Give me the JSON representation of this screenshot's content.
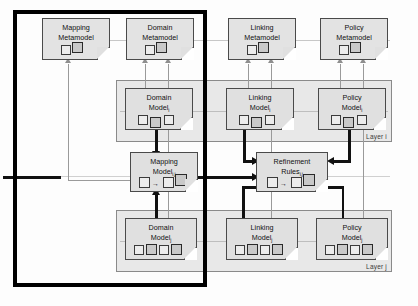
{
  "diagram": {
    "colors": {
      "layer_band": "#e8e8e8",
      "document_fill": "#e0e0e0",
      "document_stroke": "#4a4a4a",
      "transformation_arrow": "#111111",
      "conformance_arrow": "#9a9a9a",
      "highlight_frame": "#000000"
    }
  },
  "metamodels": [
    {
      "id": "mapping-metamodel",
      "line1": "Mapping",
      "line2": "Metamodel",
      "sub": "",
      "squares": 2
    },
    {
      "id": "domain-metamodel",
      "line1": "Domain",
      "line2": "Metamodel",
      "sub": "",
      "squares": 2
    },
    {
      "id": "linking-metamodel",
      "line1": "Linking",
      "line2": "Metamodel",
      "sub": "",
      "squares": 2
    },
    {
      "id": "policy-metamodel",
      "line1": "Policy",
      "line2": "Metamodel",
      "sub": "",
      "squares": 2
    }
  ],
  "layer_i": {
    "label": "Layer i",
    "models": [
      {
        "id": "domain-model-i",
        "line1": "Domain",
        "line2": "Model",
        "sub": "i",
        "squares": 3
      },
      {
        "id": "linking-model-i",
        "line1": "Linking",
        "line2": "Model",
        "sub": "i",
        "squares": 3
      },
      {
        "id": "policy-model-i",
        "line1": "Policy",
        "line2": "Model",
        "sub": "i",
        "squares": 3
      }
    ]
  },
  "layer_j": {
    "label": "Layer j",
    "models": [
      {
        "id": "domain-model-j",
        "line1": "Domain",
        "line2": "Model",
        "sub": "j",
        "squares": 4
      },
      {
        "id": "linking-model-j",
        "line1": "Linking",
        "line2": "Model",
        "sub": "j",
        "squares": 4
      },
      {
        "id": "policy-model-j",
        "line1": "Policy",
        "line2": "Model",
        "sub": "j",
        "squares": 4
      }
    ]
  },
  "middle": [
    {
      "id": "mapping-model",
      "line1": "Mapping",
      "line2": "Model",
      "sub": "i,j",
      "squares": 3,
      "rule_glyph": "→"
    },
    {
      "id": "refinement-rules",
      "line1": "Refinement",
      "line2": "Rules",
      "sub": "i,j",
      "squares": 3,
      "rule_glyph": "→"
    }
  ]
}
